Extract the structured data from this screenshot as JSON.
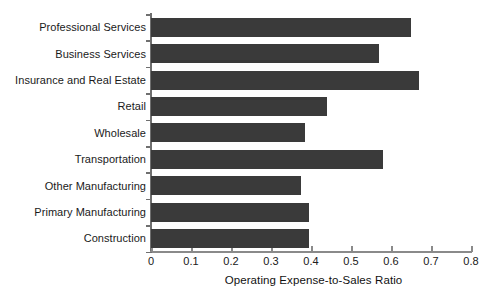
{
  "chart_data": {
    "type": "bar",
    "orientation": "horizontal",
    "title": "",
    "xlabel": "Operating Expense-to-Sales Ratio",
    "ylabel": "",
    "xlim": [
      0,
      0.8
    ],
    "xticks": [
      "0",
      "0.1",
      "0.2",
      "0.3",
      "0.4",
      "0.5",
      "0.6",
      "0.7",
      "0.8"
    ],
    "xtick_values": [
      0,
      0.1,
      0.2,
      0.3,
      0.4,
      0.5,
      0.6,
      0.7,
      0.8
    ],
    "grid": false,
    "legend": null,
    "bar_color": "#3a3a3a",
    "categories": [
      "Professional Services",
      "Business Services",
      "Insurance and Real Estate",
      "Retail",
      "Wholesale",
      "Transportation",
      "Other Manufacturing",
      "Primary Manufacturing",
      "Construction"
    ],
    "values": [
      0.65,
      0.57,
      0.67,
      0.44,
      0.385,
      0.58,
      0.375,
      0.395,
      0.395
    ]
  }
}
